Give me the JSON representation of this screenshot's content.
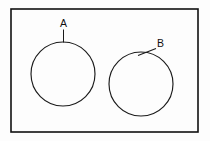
{
  "figure": {
    "canvas": {
      "width": 210,
      "height": 141,
      "background_color": "#fdfdfd"
    },
    "frame": {
      "name": "outer-rectangle",
      "x": 11,
      "y": 9,
      "width": 187,
      "height": 123,
      "stroke_color": "#111111",
      "stroke_width": 1.6,
      "fill": "none"
    },
    "shapes": [
      {
        "id": "circle-a",
        "label": "A",
        "cx": 63,
        "cy": 74,
        "r": 32,
        "stroke_color": "#1a1a1a",
        "stroke_width": 1.15,
        "fill": "none"
      },
      {
        "id": "circle-b",
        "label": "B",
        "cx": 141,
        "cy": 84,
        "r": 32,
        "stroke_color": "#1a1a1a",
        "stroke_width": 1.15,
        "fill": "none"
      }
    ],
    "labels": [
      {
        "id": "label-a",
        "text": "A",
        "text_x": 60,
        "text_y": 27,
        "font_size": 10.5,
        "color": "#111111",
        "leader": {
          "x1": 63.5,
          "y1": 29.5,
          "x2": 63.5,
          "y2": 42.5
        }
      },
      {
        "id": "label-b",
        "text": "B",
        "text_x": 157,
        "text_y": 47,
        "font_size": 10.5,
        "color": "#111111",
        "leader": {
          "x1": 156,
          "y1": 48.5,
          "x2": 138,
          "y2": 55.5
        }
      }
    ]
  }
}
